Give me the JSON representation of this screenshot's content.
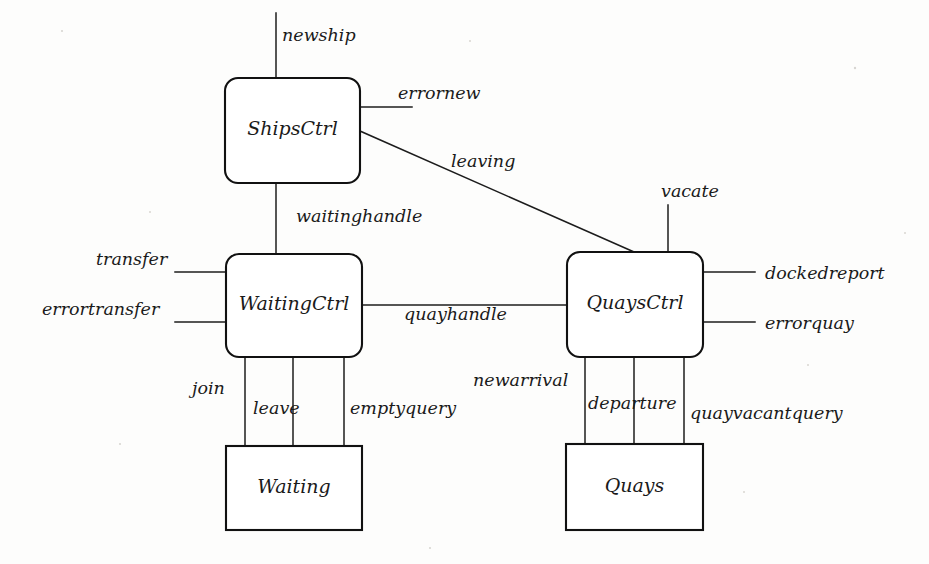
{
  "diagram": {
    "type": "block-diagram",
    "title": "",
    "background_color": "#fdfdfc",
    "line_color": "#1c1c1c",
    "boxes": [
      {
        "id": "shipsctrl",
        "label": "ShipsCtrl",
        "shape": "rounded-rect",
        "x": 225,
        "y": 78,
        "w": 135,
        "h": 105
      },
      {
        "id": "waitingctrl",
        "label": "WaitingCtrl",
        "shape": "rounded-rect",
        "x": 226,
        "y": 254,
        "w": 136,
        "h": 103
      },
      {
        "id": "quaysctrl",
        "label": "QuaysCtrl",
        "shape": "rounded-rect",
        "x": 567,
        "y": 252,
        "w": 136,
        "h": 105
      },
      {
        "id": "waiting",
        "label": "Waiting",
        "shape": "rect",
        "x": 226,
        "y": 446,
        "w": 136,
        "h": 84
      },
      {
        "id": "quays",
        "label": "Quays",
        "shape": "rect",
        "x": 566,
        "y": 444,
        "w": 137,
        "h": 86
      }
    ],
    "connections": [
      {
        "id": "newship",
        "label": "newship",
        "from": "external-top",
        "to": "shipsctrl",
        "orientation": "vertical"
      },
      {
        "id": "errornew",
        "label": "errornew",
        "from": "shipsctrl",
        "to": "external-right",
        "orientation": "horizontal"
      },
      {
        "id": "leaving",
        "label": "leaving",
        "from": "shipsctrl",
        "to": "quaysctrl",
        "orientation": "diagonal"
      },
      {
        "id": "waitinghandle",
        "label": "waitinghandle",
        "from": "shipsctrl",
        "to": "waitingctrl",
        "orientation": "vertical"
      },
      {
        "id": "transfer",
        "label": "transfer",
        "from": "external-left",
        "to": "waitingctrl",
        "orientation": "horizontal"
      },
      {
        "id": "errortransfer",
        "label": "errortransfer",
        "from": "external-left",
        "to": "waitingctrl",
        "orientation": "horizontal"
      },
      {
        "id": "quayhandle",
        "label": "quayhandle",
        "from": "waitingctrl",
        "to": "quaysctrl",
        "orientation": "horizontal"
      },
      {
        "id": "vacate",
        "label": "vacate",
        "from": "external-top",
        "to": "quaysctrl",
        "orientation": "vertical"
      },
      {
        "id": "dockedreport",
        "label": "dockedreport",
        "from": "quaysctrl",
        "to": "external-right",
        "orientation": "horizontal"
      },
      {
        "id": "errorquay",
        "label": "errorquay",
        "from": "quaysctrl",
        "to": "external-right",
        "orientation": "horizontal"
      },
      {
        "id": "join",
        "label": "join",
        "from": "waitingctrl",
        "to": "waiting",
        "orientation": "vertical"
      },
      {
        "id": "leave",
        "label": "leave",
        "from": "waitingctrl",
        "to": "waiting",
        "orientation": "vertical"
      },
      {
        "id": "emptyquery",
        "label": "emptyquery",
        "from": "waitingctrl",
        "to": "waiting",
        "orientation": "vertical"
      },
      {
        "id": "newarrival",
        "label": "newarrival",
        "from": "quaysctrl",
        "to": "quays",
        "orientation": "vertical"
      },
      {
        "id": "departure",
        "label": "departure",
        "from": "quaysctrl",
        "to": "quays",
        "orientation": "vertical"
      },
      {
        "id": "quayvacantquery",
        "label": "quayvacantquery",
        "from": "quaysctrl",
        "to": "quays",
        "orientation": "vertical"
      }
    ]
  }
}
